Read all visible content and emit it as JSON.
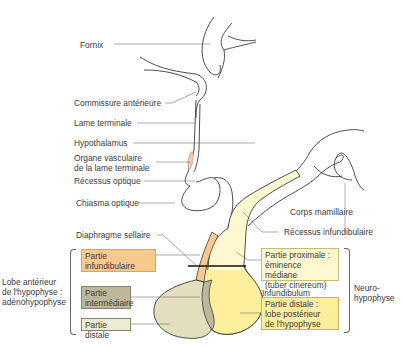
{
  "diagram": {
    "type": "anatomical-diagram",
    "colors": {
      "partie_infundibulaire": "#f8c98c",
      "partie_intermediaire": "#bdb89a",
      "partie_distale_adeno": "#ecebd4",
      "neurohypophyse_proximale": "#fdf8cf",
      "neurohypophyse_distale": "#fbef9c",
      "organe_vasculaire": "#f3c9b4",
      "line": "#3a3a3a"
    }
  },
  "labels": {
    "fornix": "Fornix",
    "commissure": "Commissure antérieure",
    "lame": "Lame terminale",
    "hypothalamus": "Hypothalamus",
    "organe_1": "Organe vasculaire",
    "organe_2": "de la lame terminale",
    "recessus_optique": "Récessus optique",
    "chiasma": "Chiasma optique",
    "corps_mamillaire": "Corps mamillaire",
    "recessus_infund": "Récessus infundibulaire",
    "diaphragme": "Diaphragme sellaire",
    "infundibulum": "Infundibulum"
  },
  "groups": {
    "adeno": {
      "line1": "Lobe antérieur",
      "line2": "de l'hypophyse :",
      "line3": "adénohypophyse",
      "boxes": {
        "infund_1": "Partie",
        "infund_2": "infundibulaire",
        "inter_1": "Partie",
        "inter_2": "intermédiaire",
        "distale": "Partie distale"
      }
    },
    "neuro": {
      "line1": "Neuro-",
      "line2": "hypophyse",
      "boxes": {
        "prox_1": "Partie proximale :",
        "prox_2": "éminence médiane",
        "prox_3": "(tuber cinereum)",
        "dist_1": "Partie distale :",
        "dist_2": "lobe postérieur",
        "dist_3": "de l'hypophyse"
      }
    }
  }
}
